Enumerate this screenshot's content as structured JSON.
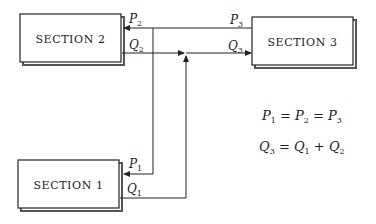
{
  "diagram": {
    "type": "flow-network",
    "sections": [
      {
        "id": "section-1",
        "label": "SECTION 1"
      },
      {
        "id": "section-2",
        "label": "SECTION 2"
      },
      {
        "id": "section-3",
        "label": "SECTION 3"
      }
    ],
    "flows": [
      {
        "symbol": "P",
        "sub": "1",
        "at": "section-1",
        "kind": "pressure"
      },
      {
        "symbol": "Q",
        "sub": "1",
        "at": "section-1",
        "kind": "flow"
      },
      {
        "symbol": "P",
        "sub": "2",
        "at": "section-2",
        "kind": "pressure"
      },
      {
        "symbol": "Q",
        "sub": "2",
        "at": "section-2",
        "kind": "flow"
      },
      {
        "symbol": "P",
        "sub": "3",
        "at": "section-3",
        "kind": "pressure"
      },
      {
        "symbol": "Q",
        "sub": "3",
        "at": "section-3",
        "kind": "flow"
      }
    ],
    "equations": [
      {
        "id": "pressure-equality",
        "text": "P1 = P2 = P3"
      },
      {
        "id": "flow-sum",
        "text": "Q3 = Q1 + Q2"
      }
    ],
    "colors": {
      "line": "#222222",
      "background": "#ffffff"
    }
  }
}
